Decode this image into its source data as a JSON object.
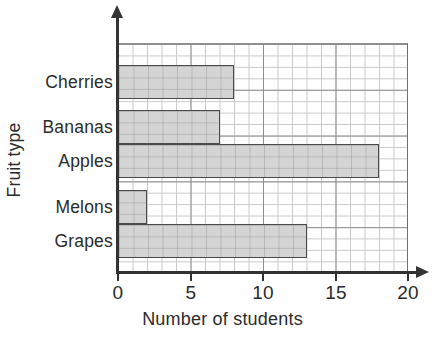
{
  "chart_data": {
    "type": "bar",
    "orientation": "horizontal",
    "title": "",
    "xlabel": "Number of students",
    "ylabel": "Fruit type",
    "categories": [
      "Cherries",
      "Bananas",
      "Apples",
      "Melons",
      "Grapes"
    ],
    "values": [
      8,
      7,
      18,
      2,
      13
    ],
    "xlim": [
      0,
      20
    ],
    "xticks": [
      0,
      5,
      10,
      15,
      20
    ],
    "xtick_labels": [
      "0",
      "5",
      "10",
      "15",
      "20"
    ],
    "grid": true,
    "grid_minor_step": 1,
    "grid_major_step": 5,
    "legend": "none",
    "colors": {
      "bar_fill": "#d4d4d4",
      "bar_border": "#4a4a4a",
      "grid_minor": "#c9c9c9",
      "grid_major": "#8e8e8e",
      "axis": "#333333",
      "text": "#2b2b2b",
      "background": "#ffffff"
    }
  }
}
